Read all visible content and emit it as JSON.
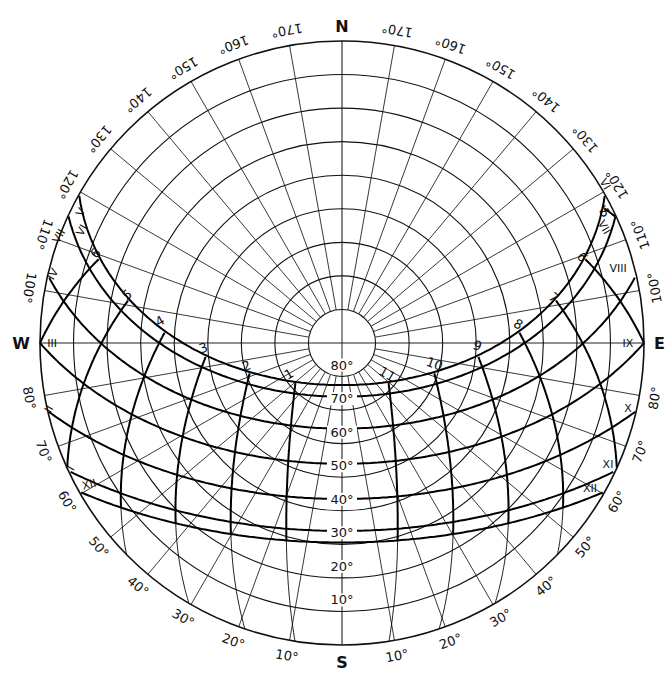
{
  "chart_data": {
    "type": "polar-sunpath",
    "projection": "equidistant azimuthal (altitude rings equally spaced)",
    "latitude_deg": 36,
    "center_px": [
      342,
      343
    ],
    "radius_px": 302,
    "compass": {
      "north": "N",
      "south": "S",
      "east": "E",
      "west": "W"
    },
    "altitude_rings_deg": [
      10,
      20,
      30,
      40,
      50,
      60,
      70,
      80
    ],
    "altitude_labels": [
      "10°",
      "20°",
      "30°",
      "40°",
      "50°",
      "60°",
      "70°",
      "80°"
    ],
    "azimuth_step_deg": 10,
    "azimuth_labels_deg": [
      10,
      20,
      30,
      40,
      50,
      60,
      70,
      80,
      100,
      110,
      120,
      130,
      140,
      150,
      160,
      170
    ],
    "azimuth_reference": "degrees measured from South toward East and toward West",
    "date_lines": [
      {
        "months": "VI",
        "declination": 23.45
      },
      {
        "months": "V / VII",
        "declination": 20.0
      },
      {
        "months": "IV / VIII",
        "declination": 10.5
      },
      {
        "months": "III / IX",
        "declination": 0.0
      },
      {
        "months": "II / X",
        "declination": -10.5
      },
      {
        "months": "I / XI",
        "declination": -20.0
      },
      {
        "months": "XII",
        "declination": -23.45
      }
    ],
    "date_labels_west": [
      {
        "text": "V",
        "x": 84,
        "y": 214,
        "rot": -60
      },
      {
        "text": "VI",
        "x": 85,
        "y": 232,
        "rot": -60
      },
      {
        "text": "VII",
        "x": 62,
        "y": 238,
        "rot": -60
      },
      {
        "text": "IV",
        "x": 56,
        "y": 276,
        "rot": -60
      },
      {
        "text": "III",
        "x": 52,
        "y": 347,
        "rot": 0
      },
      {
        "text": "II",
        "x": 52,
        "y": 411,
        "rot": -60
      },
      {
        "text": "I",
        "x": 74,
        "y": 470,
        "rot": -60
      },
      {
        "text": "XII",
        "x": 90,
        "y": 488,
        "rot": -15
      }
    ],
    "date_labels_east": [
      {
        "text": "VI",
        "x": 602,
        "y": 186,
        "rot": 60
      },
      {
        "text": "V",
        "x": 600,
        "y": 212,
        "rot": 60
      },
      {
        "text": "VII",
        "x": 601,
        "y": 229,
        "rot": 60
      },
      {
        "text": "VIII",
        "x": 618,
        "y": 272,
        "rot": 0
      },
      {
        "text": "IX",
        "x": 628,
        "y": 347,
        "rot": 0
      },
      {
        "text": "X",
        "x": 628,
        "y": 412,
        "rot": 0
      },
      {
        "text": "XI",
        "x": 608,
        "y": 468,
        "rot": 0
      },
      {
        "text": "XII",
        "x": 590,
        "y": 492,
        "rot": 0
      }
    ],
    "hour_lines": [
      {
        "label": "11",
        "hour_angle": -15
      },
      {
        "label": "10",
        "hour_angle": -30
      },
      {
        "label": "9",
        "hour_angle": -45
      },
      {
        "label": "8",
        "hour_angle": -60
      },
      {
        "label": "7",
        "hour_angle": -75
      },
      {
        "label": "6",
        "hour_angle": -90
      },
      {
        "label": "5",
        "hour_angle": -105
      },
      {
        "label": "1",
        "hour_angle": 15
      },
      {
        "label": "2",
        "hour_angle": 30
      },
      {
        "label": "3",
        "hour_angle": 45
      },
      {
        "label": "4",
        "hour_angle": 60
      },
      {
        "label": "5",
        "hour_angle": 75
      },
      {
        "label": "6",
        "hour_angle": 90
      }
    ],
    "hour_labels": [
      {
        "text": "1",
        "x": 291,
        "y": 378,
        "rot": -30
      },
      {
        "text": "2",
        "x": 248,
        "y": 370,
        "rot": -20
      },
      {
        "text": "3",
        "x": 205,
        "y": 352,
        "rot": -20
      },
      {
        "text": "4",
        "x": 162,
        "y": 325,
        "rot": -30
      },
      {
        "text": "5",
        "x": 130,
        "y": 298,
        "rot": -40
      },
      {
        "text": "6",
        "x": 99,
        "y": 256,
        "rot": -50
      },
      {
        "text": "11",
        "x": 385,
        "y": 378,
        "rot": 30
      },
      {
        "text": "10",
        "x": 433,
        "y": 368,
        "rot": 20
      },
      {
        "text": "9",
        "x": 476,
        "y": 350,
        "rot": 20
      },
      {
        "text": "8",
        "x": 516,
        "y": 328,
        "rot": 30
      },
      {
        "text": "7",
        "x": 551,
        "y": 301,
        "rot": 40
      },
      {
        "text": "6",
        "x": 579,
        "y": 260,
        "rot": 50
      },
      {
        "text": "5",
        "x": 601,
        "y": 215,
        "rot": 60
      }
    ]
  }
}
